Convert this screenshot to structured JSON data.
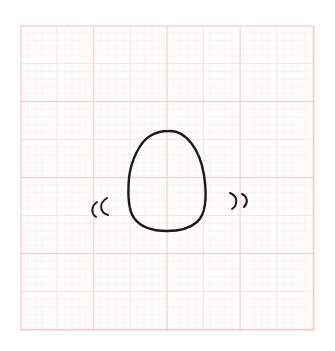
{
  "illustration": {
    "subject": "egg",
    "description": "Hand-drawn wobbling egg with motion marks on graph paper",
    "motion_marks": {
      "left": "((",
      "right": "))"
    }
  },
  "graph_paper": {
    "minor_color": "#f3dde0",
    "major_color": "#efb8c0",
    "ink_color": "#1a1a1a"
  }
}
